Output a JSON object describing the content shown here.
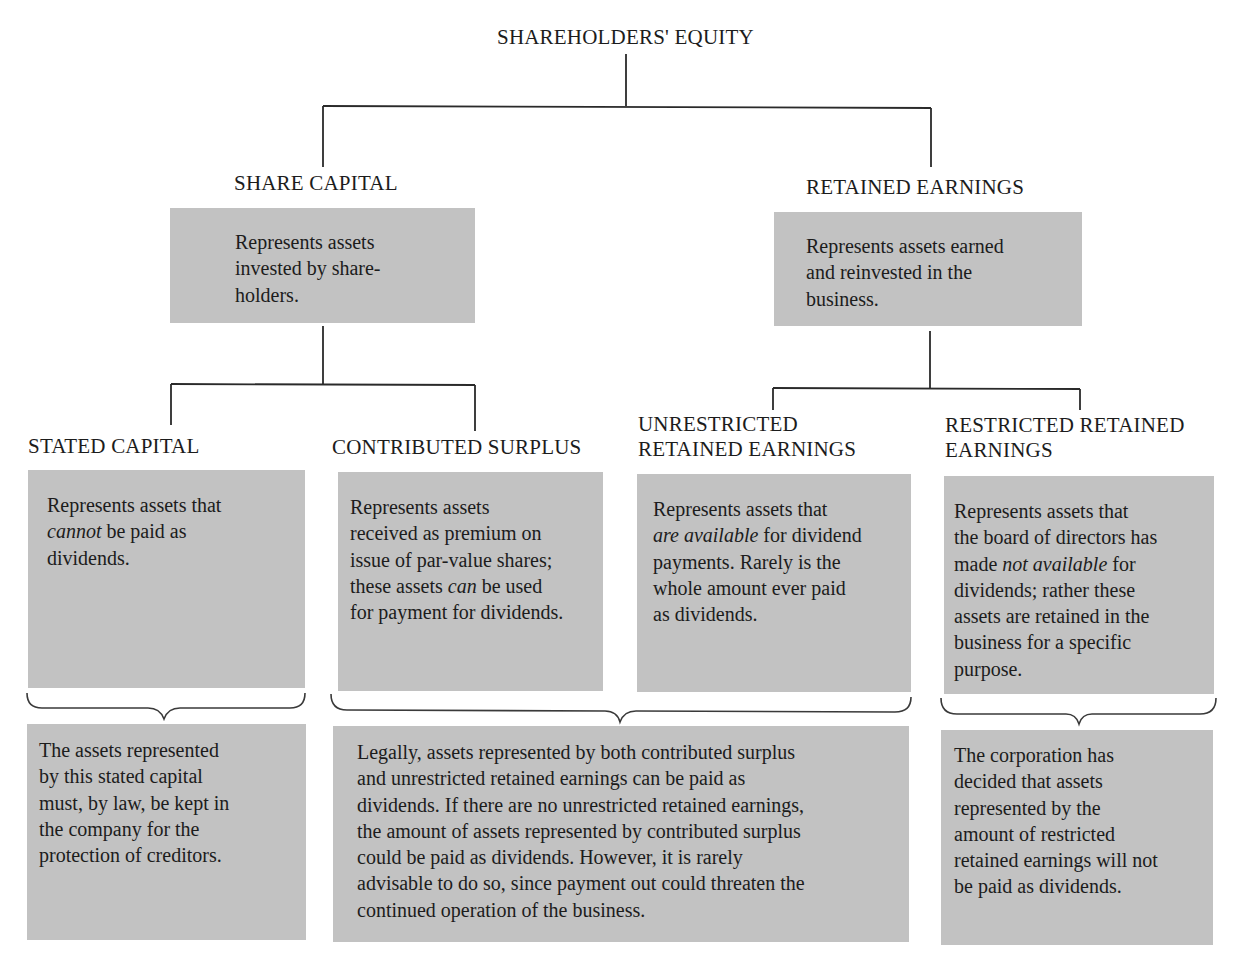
{
  "diagram": {
    "root": {
      "label": "SHAREHOLDERS' EQUITY"
    },
    "level1": [
      {
        "id": "share-capital",
        "label": "SHARE CAPITAL",
        "description": [
          "Represents assets",
          "invested by share-",
          "holders."
        ]
      },
      {
        "id": "retained-earnings",
        "label": "RETAINED EARNINGS",
        "description": [
          "Represents assets earned",
          "and reinvested in the",
          "business."
        ]
      }
    ],
    "level2": [
      {
        "id": "stated-capital",
        "label_lines": [
          "STATED CAPITAL"
        ],
        "description": [
          [
            {
              "t": "Represents assets that"
            }
          ],
          [
            {
              "t": "cannot",
              "i": true
            },
            {
              "t": " be paid as"
            }
          ],
          [
            {
              "t": "dividends."
            }
          ]
        ]
      },
      {
        "id": "contributed-surplus",
        "label_lines": [
          "CONTRIBUTED SURPLUS"
        ],
        "description": [
          [
            {
              "t": "Represents assets"
            }
          ],
          [
            {
              "t": "received as premium on"
            }
          ],
          [
            {
              "t": "issue of par-value shares;"
            }
          ],
          [
            {
              "t": "these assets "
            },
            {
              "t": "can",
              "i": true
            },
            {
              "t": " be used"
            }
          ],
          [
            {
              "t": "for payment for dividends."
            }
          ]
        ]
      },
      {
        "id": "unrestricted-retained-earnings",
        "label_lines": [
          "UNRESTRICTED",
          "RETAINED EARNINGS"
        ],
        "description": [
          [
            {
              "t": "Represents assets that"
            }
          ],
          [
            {
              "t": "are available",
              "i": true
            },
            {
              "t": " for dividend"
            }
          ],
          [
            {
              "t": "payments. Rarely is the"
            }
          ],
          [
            {
              "t": "whole amount ever paid"
            }
          ],
          [
            {
              "t": "as dividends."
            }
          ]
        ]
      },
      {
        "id": "restricted-retained-earnings",
        "label_lines": [
          "RESTRICTED RETAINED",
          "EARNINGS"
        ],
        "description": [
          [
            {
              "t": "Represents assets that"
            }
          ],
          [
            {
              "t": "the board of directors has"
            }
          ],
          [
            {
              "t": "made "
            },
            {
              "t": "not available",
              "i": true
            },
            {
              "t": " for"
            }
          ],
          [
            {
              "t": "dividends; rather these"
            }
          ],
          [
            {
              "t": "assets are retained in the"
            }
          ],
          [
            {
              "t": "business for a specific"
            }
          ],
          [
            {
              "t": "purpose."
            }
          ]
        ]
      }
    ],
    "notes": [
      {
        "id": "stated-capital-note",
        "lines": [
          "The assets represented",
          "by this stated capital",
          "must, by law, be kept in",
          "the company for the",
          "protection of creditors."
        ]
      },
      {
        "id": "dividend-eligible-note",
        "lines": [
          "Legally, assets represented by both contributed surplus",
          "and unrestricted retained earnings can be paid as",
          "dividends. If there are no unrestricted retained earnings,",
          "the amount of assets represented by contributed surplus",
          "could be paid as dividends. However, it is rarely",
          "advisable to do so, since payment out could threaten the",
          "continued operation of the business."
        ]
      },
      {
        "id": "restricted-note",
        "lines": [
          "The corporation has",
          "decided that assets",
          "represented by the",
          "amount of restricted",
          "retained earnings will not",
          "be paid as dividends."
        ]
      }
    ]
  },
  "colors": {
    "box_fill": "#c2c2c2",
    "line": "#2a2a2a",
    "text": "#1c1c1c",
    "background": "#ffffff"
  }
}
